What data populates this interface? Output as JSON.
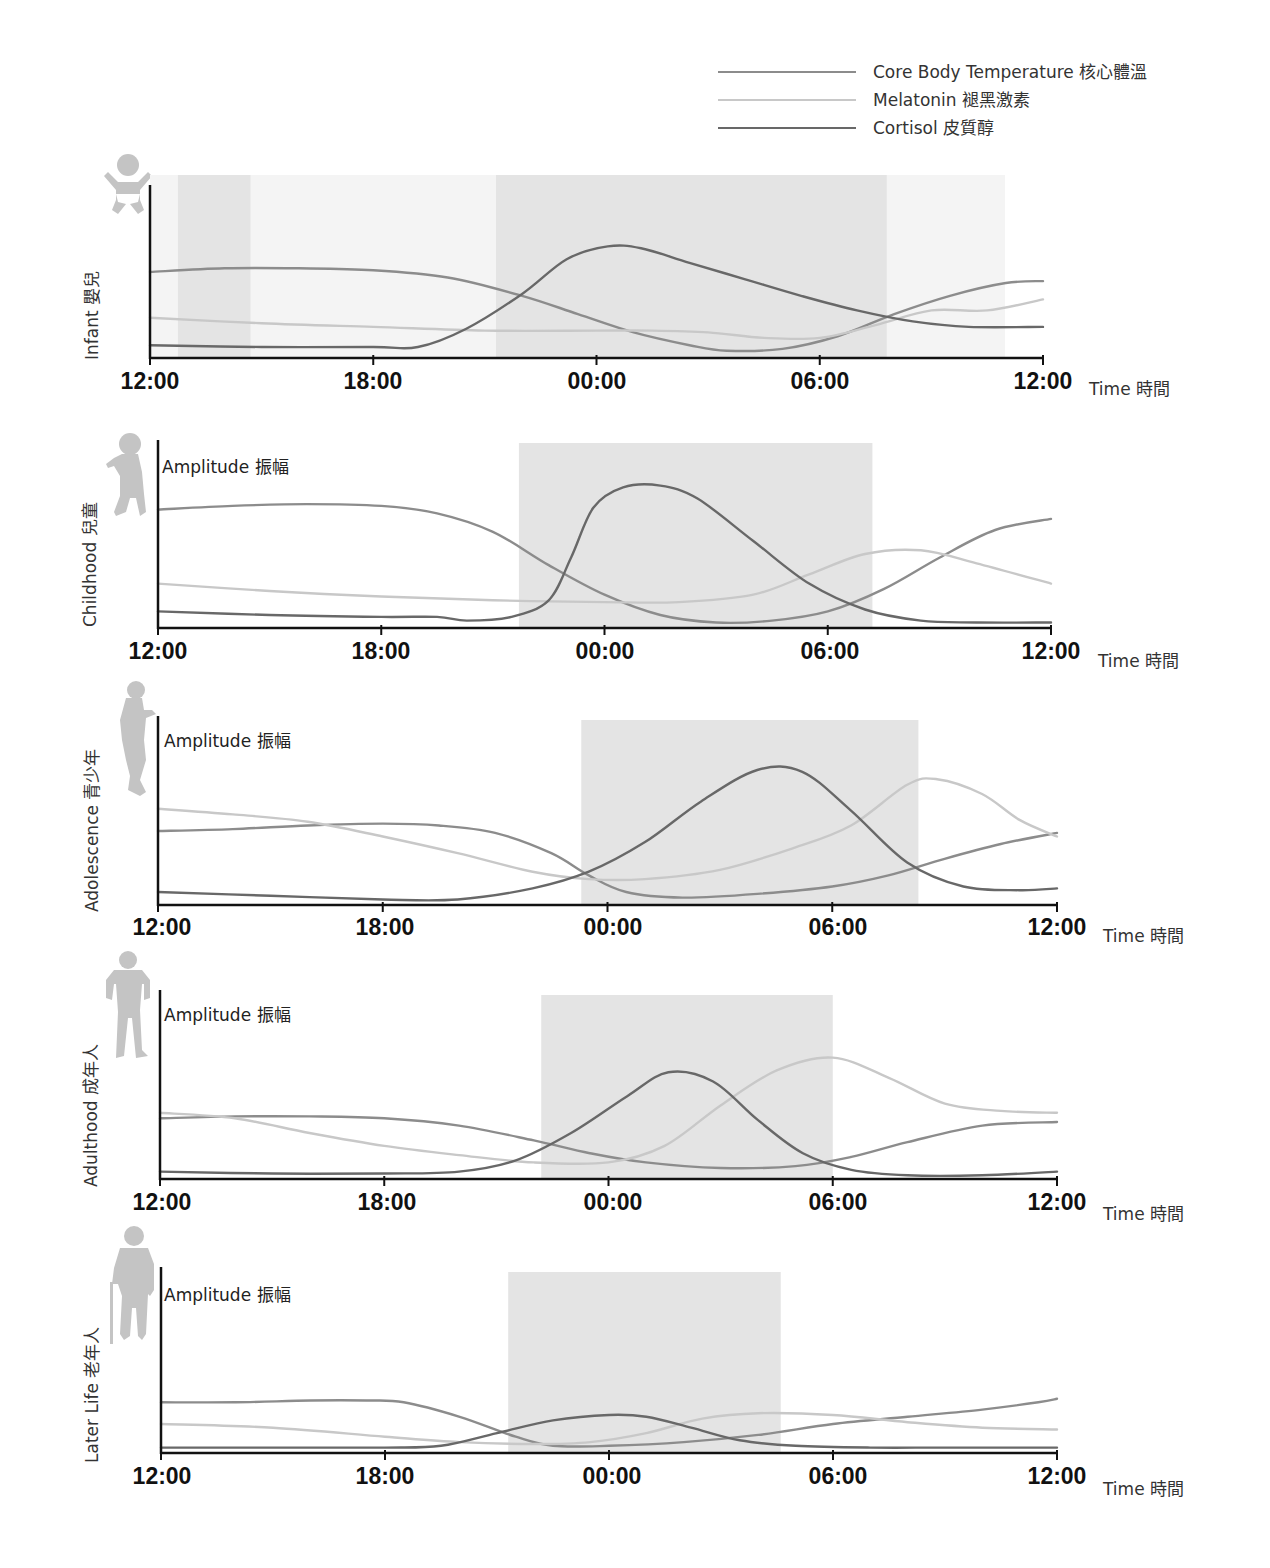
{
  "legend": {
    "items": [
      {
        "label": "Core Body Temperature 核心體溫",
        "color": "#8c8c8c",
        "key": "core"
      },
      {
        "label": "Melatonin 褪黑激素",
        "color": "#c8c8c8",
        "key": "melatonin"
      },
      {
        "label": "Cortisol 皮質醇",
        "color": "#686868",
        "key": "cortisol"
      }
    ]
  },
  "axis": {
    "y_label": "Amplitude 振幅",
    "x_label": "Time 時間",
    "ticks": [
      "12:00",
      "18:00",
      "00:00",
      "06:00",
      "12:00"
    ]
  },
  "colors": {
    "shade": "#e4e4e4",
    "faint_shade": "#f4f4f4",
    "axis": "#111111",
    "icon": "#c4c4c4"
  },
  "chart_data": [
    {
      "type": "line",
      "title": "Infant 嬰兒",
      "xlabel": "Time 時間",
      "ylabel": "Amplitude 振幅",
      "x_ticks": [
        "12:00",
        "18:00",
        "00:00",
        "06:00",
        "12:00"
      ],
      "x_unit": "hours since 12:00",
      "xlim": [
        0,
        24
      ],
      "ylim": [
        0,
        100
      ],
      "shaded_periods": [
        [
          0.75,
          2.7
        ],
        [
          9.3,
          19.8
        ]
      ],
      "series": [
        {
          "name": "Core Body Temperature 核心體溫",
          "x": [
            0,
            2,
            4,
            6,
            8,
            10,
            11.5,
            13,
            14.5,
            15.5,
            17,
            18.5,
            20,
            21.5,
            23,
            24
          ],
          "values": [
            47,
            49,
            49,
            48,
            44,
            34,
            24,
            14,
            7,
            4,
            5,
            12,
            24,
            34,
            41,
            42
          ]
        },
        {
          "name": "Melatonin 褪黑激素",
          "x": [
            0,
            3,
            6,
            9,
            12,
            13.5,
            15,
            16.5,
            18,
            19.5,
            21,
            22.5,
            24
          ],
          "values": [
            22,
            19,
            17,
            15,
            15,
            15,
            14,
            11,
            11,
            18,
            26,
            26,
            32
          ]
        },
        {
          "name": "Cortisol 皮質醇",
          "x": [
            0,
            3,
            6,
            7.2,
            8.5,
            10,
            11.2,
            12.3,
            13.2,
            14.5,
            16,
            17.5,
            19,
            20.5,
            22,
            24
          ],
          "values": [
            7,
            6,
            6,
            6,
            16,
            35,
            54,
            61,
            60,
            52,
            43,
            34,
            26,
            20,
            17,
            17
          ]
        }
      ]
    },
    {
      "type": "line",
      "title": "Childhood 兒童",
      "xlabel": "Time 時間",
      "ylabel": "Amplitude 振幅",
      "x_ticks": [
        "12:00",
        "18:00",
        "00:00",
        "06:00",
        "12:00"
      ],
      "xlim": [
        0,
        24
      ],
      "ylim": [
        0,
        100
      ],
      "shaded_periods": [
        [
          9.7,
          19.2
        ]
      ],
      "series": [
        {
          "name": "Core Body Temperature 核心體溫",
          "x": [
            0,
            2,
            4,
            6,
            7.5,
            9,
            10.5,
            12,
            13.5,
            15,
            16.5,
            18,
            19.5,
            21,
            22.5,
            24
          ],
          "values": [
            64,
            66,
            67,
            66,
            62,
            52,
            34,
            18,
            7,
            3,
            4,
            9,
            21,
            38,
            53,
            59
          ]
        },
        {
          "name": "Melatonin 褪黑激素",
          "x": [
            0,
            3,
            6,
            9,
            12,
            14,
            16,
            17.5,
            19,
            20.5,
            22,
            24
          ],
          "values": [
            24,
            20,
            17,
            15,
            14,
            14,
            18,
            29,
            40,
            42,
            35,
            24
          ]
        },
        {
          "name": "Cortisol 皮質醇",
          "x": [
            0,
            3,
            6,
            7.5,
            8.3,
            9.5,
            10.5,
            11.1,
            11.7,
            12.5,
            13.5,
            14.5,
            16,
            17.5,
            19,
            20.5,
            22,
            24
          ],
          "values": [
            9,
            7,
            6,
            6,
            4,
            6,
            15,
            38,
            65,
            76,
            77,
            70,
            47,
            24,
            10,
            4,
            3,
            3
          ]
        }
      ]
    },
    {
      "type": "line",
      "title": "Adolescence 青少年",
      "xlabel": "Time 時間",
      "ylabel": "Amplitude 振幅",
      "x_ticks": [
        "12:00",
        "18:00",
        "00:00",
        "06:00",
        "12:00"
      ],
      "xlim": [
        0,
        24
      ],
      "ylim": [
        0,
        100
      ],
      "shaded_periods": [
        [
          11.3,
          20.3
        ]
      ],
      "series": [
        {
          "name": "Core Body Temperature 核心體溫",
          "x": [
            0,
            2,
            4,
            6,
            7.5,
            9,
            10.5,
            11.5,
            12.5,
            14,
            16,
            18,
            19.5,
            21,
            22.5,
            24
          ],
          "values": [
            40,
            41,
            43,
            44,
            43,
            39,
            28,
            16,
            7,
            4,
            6,
            10,
            16,
            25,
            33,
            39
          ]
        },
        {
          "name": "Melatonin 褪黑激素",
          "x": [
            0,
            2,
            4,
            6,
            8,
            10,
            11.5,
            13,
            15,
            17,
            18.5,
            20,
            20.8,
            22,
            23,
            24
          ],
          "values": [
            52,
            49,
            45,
            37,
            28,
            18,
            14,
            14,
            19,
            31,
            43,
            65,
            68,
            60,
            46,
            37
          ]
        },
        {
          "name": "Cortisol 皮質醇",
          "x": [
            0,
            3,
            6,
            8,
            10,
            11.5,
            13,
            14.5,
            16,
            17.2,
            18.5,
            20,
            21.5,
            23,
            24
          ],
          "values": [
            7,
            5,
            3,
            3,
            9,
            18,
            34,
            56,
            73,
            72,
            51,
            23,
            10,
            8,
            9
          ]
        }
      ]
    },
    {
      "type": "line",
      "title": "Adulthood 成年人",
      "xlabel": "Time 時間",
      "ylabel": "Amplitude 振幅",
      "x_ticks": [
        "12:00",
        "18:00",
        "00:00",
        "06:00",
        "12:00"
      ],
      "xlim": [
        0,
        24
      ],
      "ylim": [
        0,
        100
      ],
      "shaded_periods": [
        [
          10.2,
          18.0
        ]
      ],
      "series": [
        {
          "name": "Core Body Temperature 核心體溫",
          "x": [
            0,
            2,
            4,
            6,
            8,
            10,
            11.5,
            13,
            15,
            17,
            18.5,
            20,
            22,
            24
          ],
          "values": [
            33,
            34,
            34,
            33,
            29,
            21,
            14,
            9,
            6,
            7,
            12,
            20,
            29,
            31
          ]
        },
        {
          "name": "Melatonin 褪黑激素",
          "x": [
            0,
            2,
            4,
            6,
            8,
            10,
            12,
            13.5,
            15,
            16.5,
            18,
            19.5,
            21,
            22.5,
            24
          ],
          "values": [
            36,
            33,
            25,
            18,
            13,
            9,
            9,
            18,
            40,
            59,
            66,
            55,
            41,
            37,
            36
          ]
        },
        {
          "name": "Cortisol 皮質醇",
          "x": [
            0,
            3,
            6,
            8,
            9.5,
            11,
            12.5,
            13.6,
            14.8,
            16,
            17.2,
            18.5,
            20,
            22,
            24
          ],
          "values": [
            4,
            3,
            3,
            4,
            10,
            25,
            45,
            58,
            53,
            32,
            14,
            5,
            2,
            2,
            4
          ]
        }
      ]
    },
    {
      "type": "line",
      "title": "Later Life 老年人",
      "xlabel": "Time 時間",
      "ylabel": "Amplitude 振幅",
      "x_ticks": [
        "12:00",
        "18:00",
        "00:00",
        "06:00",
        "12:00"
      ],
      "xlim": [
        0,
        24
      ],
      "ylim": [
        0,
        100
      ],
      "shaded_periods": [
        [
          9.3,
          16.6
        ]
      ],
      "series": [
        {
          "name": "Core Body Temperature 核心體溫",
          "x": [
            0,
            2,
            4,
            5.5,
            6.5,
            8,
            9.5,
            10.5,
            12,
            14,
            16,
            18,
            20,
            22,
            23.5,
            24
          ],
          "values": [
            28,
            28,
            29,
            29,
            28,
            20,
            9,
            4,
            4,
            6,
            10,
            16,
            20,
            24,
            28,
            30
          ]
        },
        {
          "name": "Melatonin 褪黑激素",
          "x": [
            0,
            3,
            6,
            8,
            10,
            11.5,
            13,
            14.5,
            16,
            18,
            20,
            22,
            24
          ],
          "values": [
            16,
            14,
            9,
            6,
            5,
            6,
            11,
            19,
            22,
            21,
            17,
            14,
            13
          ]
        },
        {
          "name": "Cortisol 皮質醇",
          "x": [
            0,
            3,
            6,
            7.5,
            9,
            10.5,
            12,
            13,
            14.2,
            15.5,
            17,
            19,
            21,
            24
          ],
          "values": [
            3,
            3,
            3,
            4,
            11,
            18,
            21,
            20,
            14,
            7,
            4,
            3,
            3,
            3
          ]
        }
      ]
    }
  ],
  "panels": [
    {
      "label": "Infant 嬰兒",
      "icon": "infant-silhouette-icon"
    },
    {
      "label": "Childhood 兒童",
      "icon": "toddler-silhouette-icon"
    },
    {
      "label": "Adolescence 青少年",
      "icon": "teen-silhouette-icon"
    },
    {
      "label": "Adulthood 成年人",
      "icon": "adult-silhouette-icon"
    },
    {
      "label": "Later Life 老年人",
      "icon": "elder-with-cane-silhouette-icon"
    }
  ]
}
